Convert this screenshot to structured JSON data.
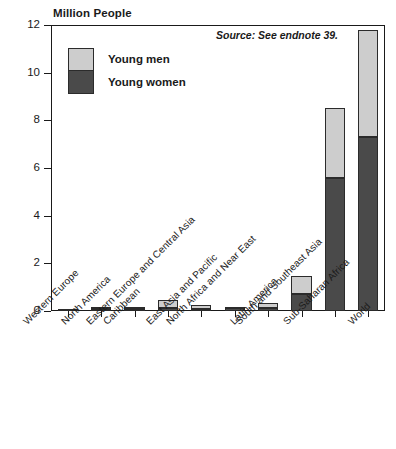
{
  "chart_data": {
    "type": "bar",
    "stacked": true,
    "title": "",
    "ylabel": "Million People",
    "xlabel": "",
    "ylim": [
      0,
      12
    ],
    "ytick_values": [
      0,
      2,
      4,
      6,
      8,
      10,
      12
    ],
    "ytick_labels": [
      "0",
      "2",
      "4",
      "6",
      "8",
      "10",
      "12"
    ],
    "grid": false,
    "legend_position": "upper-left-inside",
    "annotation": "Source: See endnote 39.",
    "categories": [
      "Western Europe",
      "North America",
      "Caribbean",
      "Eastern Europe and Central Asia",
      "East Asia and Pacific",
      "North Africa and Near East",
      "Latin America",
      "South and Southeast Asia",
      "Sub-Saharan Africa",
      "World"
    ],
    "series": [
      {
        "name": "Young women",
        "color": "#4a4a4a",
        "values": [
          0.05,
          0.08,
          0.1,
          0.13,
          0.08,
          0.12,
          0.13,
          0.72,
          5.6,
          7.3
        ]
      },
      {
        "name": "Young men",
        "color": "#cdcdcd",
        "values": [
          0.03,
          0.07,
          0.05,
          0.32,
          0.19,
          0.03,
          0.22,
          0.75,
          2.9,
          4.5
        ]
      }
    ],
    "totals": [
      0.08,
      0.15,
      0.15,
      0.45,
      0.27,
      0.15,
      0.35,
      1.47,
      8.5,
      11.8
    ]
  },
  "legend": {
    "men_label": "Young men",
    "women_label": "Young women"
  },
  "colors": {
    "young_men": "#cdcdcd",
    "young_women": "#4a4a4a",
    "axis": "#1a1a1a",
    "background": "#ffffff"
  }
}
